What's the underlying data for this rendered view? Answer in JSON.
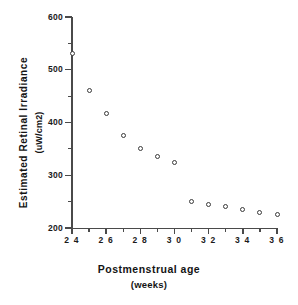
{
  "chart_data": {
    "type": "scatter",
    "title": "",
    "xlabel": "Postmenstrual  age",
    "xlabel_units": "(weeks)",
    "ylabel": "Estimated  Retinal  Irradiance",
    "ylabel_units": "(uW/cm2)",
    "xlim": [
      24,
      36
    ],
    "ylim": [
      200,
      600
    ],
    "x_major_ticks": [
      24,
      26,
      28,
      30,
      32,
      34,
      36
    ],
    "x_minor_ticks": [
      25,
      27,
      29,
      31,
      33,
      35
    ],
    "x_tick_labels": [
      "2 4",
      "2 6",
      "2 8",
      "3 0",
      "3 2",
      "3 4",
      "3 6"
    ],
    "y_major_ticks": [
      200,
      300,
      400,
      500,
      600
    ],
    "y_minor_ticks": [
      250,
      350,
      450,
      550
    ],
    "y_tick_labels": [
      "200",
      "300",
      "400",
      "500",
      "600"
    ],
    "grid": false,
    "legend": false,
    "marker": "open-circle",
    "marker_color": "#3a3a3a",
    "x": [
      24,
      25,
      26,
      27,
      28,
      29,
      30,
      31,
      32,
      33,
      34,
      35,
      36
    ],
    "y": [
      530,
      461,
      418,
      375,
      350,
      336,
      325,
      250,
      245,
      240,
      235,
      230,
      225
    ],
    "points": [
      {
        "x": 24,
        "y": 530
      },
      {
        "x": 25,
        "y": 461
      },
      {
        "x": 26,
        "y": 418
      },
      {
        "x": 27,
        "y": 375
      },
      {
        "x": 28,
        "y": 350
      },
      {
        "x": 29,
        "y": 336
      },
      {
        "x": 30,
        "y": 325
      },
      {
        "x": 31,
        "y": 250
      },
      {
        "x": 32,
        "y": 245
      },
      {
        "x": 33,
        "y": 240
      },
      {
        "x": 34,
        "y": 235
      },
      {
        "x": 35,
        "y": 230
      },
      {
        "x": 36,
        "y": 225
      }
    ]
  }
}
